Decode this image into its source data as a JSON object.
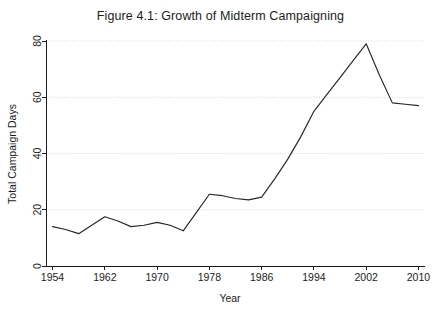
{
  "chart_data": {
    "type": "line",
    "title": "Figure 4.1: Growth of Midterm Campaigning",
    "xlabel": "Year",
    "ylabel": "Total Campaign Days",
    "xlim": [
      1953,
      2011
    ],
    "ylim": [
      0,
      80
    ],
    "grid": true,
    "legend": false,
    "xticks": [
      1954,
      1962,
      1970,
      1978,
      1986,
      1994,
      2002,
      2010
    ],
    "xtick_labels": [
      "1954",
      "1962",
      "1970",
      "1978",
      "1986",
      "1994",
      "2002",
      "2010"
    ],
    "yticks": [
      0,
      20,
      40,
      60,
      80
    ],
    "ytick_labels": [
      "0",
      "20",
      "40",
      "60",
      "80"
    ],
    "series": [
      {
        "name": "Total Campaign Days",
        "color": "#262626",
        "x": [
          1954,
          1956,
          1958,
          1960,
          1962,
          1964,
          1966,
          1968,
          1970,
          1972,
          1974,
          1976,
          1978,
          1980,
          1982,
          1984,
          1986,
          1988,
          1990,
          1992,
          1994,
          1996,
          1998,
          2000,
          2002,
          2004,
          2006,
          2008,
          2010
        ],
        "values": [
          14,
          13,
          11.5,
          14.5,
          17.5,
          16,
          14,
          14.5,
          15.5,
          14.5,
          12.5,
          19,
          25.5,
          25,
          24,
          23.5,
          24.5,
          31,
          38,
          46,
          55,
          61,
          67,
          73,
          79,
          68,
          58,
          57.5,
          57
        ]
      }
    ]
  }
}
